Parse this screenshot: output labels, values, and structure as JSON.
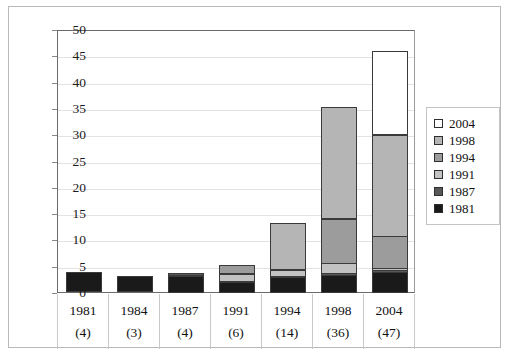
{
  "chart_data": {
    "type": "bar",
    "stacked": true,
    "title": "",
    "subtitle": "",
    "xlabel": "",
    "ylabel": "",
    "ylim": [
      0,
      50
    ],
    "ytick_step": 5,
    "yticks": [
      "0",
      "5",
      "10",
      "15",
      "20",
      "25",
      "30",
      "35",
      "40",
      "45",
      "50"
    ],
    "grid": true,
    "legend_position": "right",
    "categories": [
      "1981",
      "1984",
      "1987",
      "1991",
      "1994",
      "1998",
      "2004"
    ],
    "category_counts": [
      "(4)",
      "(3)",
      "(4)",
      "(6)",
      "(14)",
      "(36)",
      "(47)"
    ],
    "category_totals": [
      3.9,
      3.0,
      3.8,
      5.7,
      13.7,
      36.0,
      46.7
    ],
    "series": [
      {
        "name": "1981",
        "color": "#1a1a1a",
        "values": [
          3.9,
          3.0,
          3.2,
          2.0,
          3.0,
          3.5,
          4.0
        ]
      },
      {
        "name": "1987",
        "color": "#575757",
        "values": [
          0,
          0,
          0.6,
          0.4,
          0.5,
          0.5,
          0.6
        ]
      },
      {
        "name": "1991",
        "color": "#c2c2c2",
        "values": [
          0,
          0,
          0,
          1.6,
          1.3,
          2.1,
          0.6
        ]
      },
      {
        "name": "1994",
        "color": "#9c9c9c",
        "values": [
          0,
          0,
          0,
          1.7,
          0,
          8.6,
          6.3
        ]
      },
      {
        "name": "1998",
        "color": "#b5b5b5",
        "values": [
          0,
          0,
          0,
          0,
          8.9,
          21.3,
          19.4
        ]
      },
      {
        "name": "2004",
        "color": "#ffffff",
        "values": [
          0,
          0,
          0,
          0,
          0,
          0,
          15.8
        ]
      }
    ],
    "legend_entries": [
      {
        "label": "2004",
        "color": "#ffffff"
      },
      {
        "label": "1998",
        "color": "#b5b5b5"
      },
      {
        "label": "1994",
        "color": "#9c9c9c"
      },
      {
        "label": "1991",
        "color": "#c2c2c2"
      },
      {
        "label": "1987",
        "color": "#575757"
      },
      {
        "label": "1981",
        "color": "#1a1a1a"
      }
    ]
  }
}
